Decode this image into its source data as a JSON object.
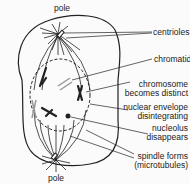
{
  "diagram": {
    "labels": {
      "pole_top": "pole",
      "pole_bottom": "pole",
      "centrioles": "centrioles",
      "chromatid": "chromatid",
      "chromosome_line1": "chromosome",
      "chromosome_line2": "becomes distinct",
      "envelope_line1": "nuclear envelope",
      "envelope_line2": "disintegrating",
      "nucleolus_line1": "nucleolus",
      "nucleolus_line2": "disappears",
      "spindle_line1": "spindle forms",
      "spindle_line2": "(microtubules)"
    },
    "colors": {
      "line": "#222222",
      "chromosome_light": "#999999",
      "background": "#fbfbfb"
    }
  }
}
